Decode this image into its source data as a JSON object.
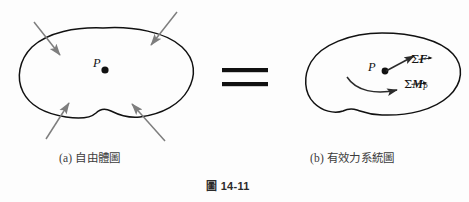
{
  "figure": {
    "number_prefix": "圖",
    "number": "14-11",
    "background_color": "#fdfdfd",
    "outline_color": "#111111",
    "arrow_color": "#7e7e7e",
    "vector_color": "#2b2b2b"
  },
  "panel_a": {
    "caption": "(a) 自由體圖",
    "point_label": "P",
    "shape": "closed-irregular-blob",
    "applied_force_arrows": [
      {
        "name": "top-left-force-arrow",
        "from": [
          34,
          22
        ],
        "to": [
          60,
          55
        ]
      },
      {
        "name": "top-right-force-arrow",
        "from": [
          177,
          12
        ],
        "to": [
          151,
          45
        ]
      },
      {
        "name": "bottom-left-force-arrow",
        "from": [
          46,
          139
        ],
        "to": [
          69,
          103
        ]
      },
      {
        "name": "bottom-right-force-arrow",
        "from": [
          165,
          141
        ],
        "to": [
          132,
          104
        ]
      }
    ]
  },
  "equals": {
    "symbol": "=",
    "bar_count": 2
  },
  "panel_b": {
    "caption": "(b) 有效力系統圖",
    "point_label": "P",
    "resultant_force_label": "ΣF",
    "resultant_moment_label": "ΣM",
    "resultant_moment_subscript": "P",
    "force_vector": {
      "from": [
        386,
        71
      ],
      "to": [
        414,
        56
      ]
    },
    "moment_arc": {
      "from": [
        347,
        77
      ],
      "to": [
        398,
        90
      ]
    }
  }
}
